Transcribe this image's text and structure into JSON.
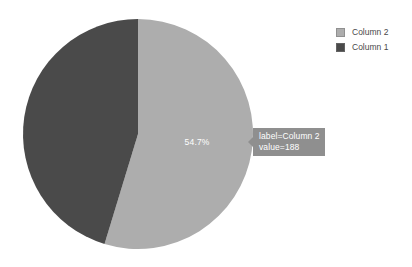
{
  "chart_data": {
    "type": "pie",
    "title": "",
    "categories": [
      "Column 2",
      "Column 1"
    ],
    "values": [
      188,
      156
    ],
    "percentages": [
      54.7,
      45.3
    ],
    "colors": [
      "#adadad",
      "#4a4a4a"
    ],
    "start_angle_deg": 0,
    "direction": "clockwise",
    "data_labels": [
      "54.7%",
      ""
    ],
    "legend": {
      "position": "top-right",
      "entries": [
        {
          "label": "Column 2",
          "color": "#adadad"
        },
        {
          "label": "Column 1",
          "color": "#4a4a4a"
        }
      ]
    },
    "tooltip": {
      "line1": "label=Column 2",
      "line2": "value=188",
      "background": "#8f8f8f",
      "text_color": "#ffffff"
    }
  },
  "geometry": {
    "center_x": 138,
    "center_y": 134,
    "radius": 115
  },
  "slice_label_text": "54.7%",
  "background": "#ffffff"
}
